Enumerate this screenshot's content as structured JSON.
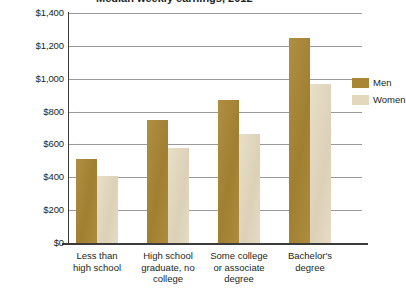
{
  "chart_data": {
    "type": "bar",
    "title": "Median weekly earnings, 2012",
    "xlabel": "",
    "ylabel": "",
    "ylim": [
      0,
      1400
    ],
    "ytick_step": 200,
    "ytick_labels": [
      "$0",
      "$200",
      "$400",
      "$600",
      "$800",
      "$1,000",
      "$1,200",
      "$1,400"
    ],
    "ytick_values": [
      0,
      200,
      400,
      600,
      800,
      1000,
      1200,
      1400
    ],
    "grid": true,
    "legend_position": "right",
    "categories": [
      "Less than\nhigh school",
      "High school\ngraduate, no\ncollege",
      "Some college\nor associate\ndegree",
      "Bachelor's\ndegree"
    ],
    "series": [
      {
        "name": "Men",
        "color": "#a98634",
        "values": [
          510,
          750,
          870,
          1245
        ]
      },
      {
        "name": "Women",
        "color": "#e3d8bd",
        "values": [
          405,
          580,
          665,
          965
        ]
      }
    ]
  },
  "legend": {
    "items": [
      {
        "label": "Men",
        "color": "#a98634"
      },
      {
        "label": "Women",
        "color": "#e3d8bd"
      }
    ]
  },
  "axis": {
    "y_labels": [
      "$1,400",
      "$1,200",
      "$1,000",
      "$800",
      "$600",
      "$400",
      "$200",
      "$0"
    ]
  },
  "categories": [
    {
      "line1": "Less than",
      "line2": "high school",
      "line3": ""
    },
    {
      "line1": "High school",
      "line2": "graduate, no",
      "line3": "college"
    },
    {
      "line1": "Some college",
      "line2": "or associate",
      "line3": "degree"
    },
    {
      "line1": "Bachelor's",
      "line2": "degree",
      "line3": ""
    }
  ],
  "colors": {
    "men": "#a98634",
    "women": "#e3d8bd",
    "grid": "#9a9a9a",
    "axis": "#3b3b3b",
    "text": "#231f20",
    "background": "#ffffff"
  }
}
